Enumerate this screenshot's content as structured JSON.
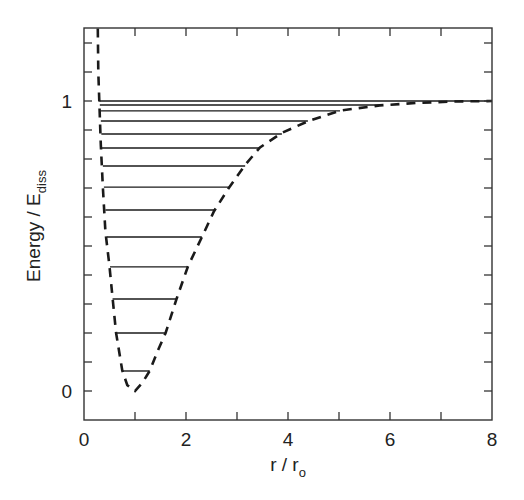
{
  "chart_data": {
    "type": "line",
    "title": "",
    "xlabel": "r / r",
    "xlabel_subscript": "o",
    "ylabel": "Energy / E",
    "ylabel_subscript": "diss",
    "xlim": [
      0,
      8
    ],
    "ylim": [
      -0.1,
      1.25
    ],
    "x_ticks": [
      0,
      2,
      4,
      6,
      8
    ],
    "x_minor_ticks": [
      1,
      3,
      5,
      7
    ],
    "y_ticks": [
      0,
      1
    ],
    "y_minor_ticks": [
      0.1,
      0.2,
      0.3,
      0.4,
      0.5,
      0.6,
      0.7,
      0.8,
      0.9,
      1.1,
      1.2
    ],
    "grid": false,
    "legend": null,
    "series": [
      {
        "name": "potential energy curve",
        "style": "dashed",
        "points": [
          [
            0.27,
            1.25
          ],
          [
            0.28,
            1.1
          ],
          [
            0.3,
            1.0
          ],
          [
            0.33,
            0.85
          ],
          [
            0.37,
            0.7
          ],
          [
            0.42,
            0.55
          ],
          [
            0.5,
            0.43
          ],
          [
            0.56,
            0.32
          ],
          [
            0.63,
            0.2
          ],
          [
            0.75,
            0.07
          ],
          [
            0.85,
            0.02
          ],
          [
            1.0,
            0.0
          ],
          [
            1.15,
            0.03
          ],
          [
            1.29,
            0.07
          ],
          [
            1.45,
            0.14
          ],
          [
            1.6,
            0.2
          ],
          [
            1.82,
            0.32
          ],
          [
            2.04,
            0.43
          ],
          [
            2.31,
            0.53
          ],
          [
            2.55,
            0.62
          ],
          [
            2.84,
            0.7
          ],
          [
            3.16,
            0.78
          ],
          [
            3.45,
            0.84
          ],
          [
            3.88,
            0.89
          ],
          [
            4.39,
            0.93
          ],
          [
            5.02,
            0.967
          ],
          [
            5.8,
            0.985
          ],
          [
            6.5,
            0.993
          ],
          [
            7.2,
            0.998
          ],
          [
            8.0,
            1.0
          ]
        ]
      },
      {
        "name": "vibrational energy levels",
        "style": "solid",
        "levels": [
          {
            "energy": 0.069,
            "r_min": 0.75,
            "r_max": 1.29
          },
          {
            "energy": 0.2,
            "r_min": 0.63,
            "r_max": 1.6
          },
          {
            "energy": 0.317,
            "r_min": 0.56,
            "r_max": 1.82
          },
          {
            "energy": 0.428,
            "r_min": 0.51,
            "r_max": 2.04
          },
          {
            "energy": 0.531,
            "r_min": 0.45,
            "r_max": 2.31
          },
          {
            "energy": 0.624,
            "r_min": 0.42,
            "r_max": 2.55
          },
          {
            "energy": 0.703,
            "r_min": 0.39,
            "r_max": 2.84
          },
          {
            "energy": 0.776,
            "r_min": 0.37,
            "r_max": 3.16
          },
          {
            "energy": 0.838,
            "r_min": 0.35,
            "r_max": 3.45
          },
          {
            "energy": 0.886,
            "r_min": 0.34,
            "r_max": 3.88
          },
          {
            "energy": 0.931,
            "r_min": 0.33,
            "r_max": 4.39
          },
          {
            "energy": 0.966,
            "r_min": 0.32,
            "r_max": 5.02
          },
          {
            "energy": 0.986,
            "r_min": 0.31,
            "r_max": 5.8
          },
          {
            "energy": 1.0,
            "r_min": 0.3,
            "r_max": 8.0
          }
        ]
      }
    ]
  },
  "colors": {
    "line": "#1a1a1a",
    "axis": "#333333",
    "background": "#ffffff"
  }
}
